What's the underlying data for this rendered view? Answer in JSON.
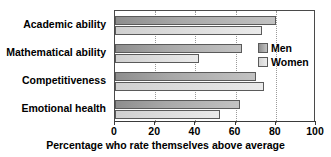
{
  "chart_data": {
    "type": "bar",
    "orientation": "horizontal",
    "title": "",
    "xlabel": "Percentage who rate themselves above average",
    "ylabel": "",
    "xlim": [
      0,
      100
    ],
    "xticks": [
      0,
      20,
      40,
      60,
      80,
      100
    ],
    "xtick_labels": [
      "0",
      "20",
      "40",
      "60",
      "80",
      "100"
    ],
    "grid": true,
    "legend_position": "inside-right",
    "categories": [
      "Academic ability",
      "Mathematical ability",
      "Competitiveness",
      "Emotional health"
    ],
    "series": [
      {
        "name": "Men",
        "color": "#a8a8a8",
        "values": [
          80,
          63,
          70,
          62
        ]
      },
      {
        "name": "Women",
        "color": "#dcdcdc",
        "values": [
          73,
          42,
          74,
          52
        ]
      }
    ]
  },
  "legend": {
    "items": [
      {
        "label": "Men"
      },
      {
        "label": "Women"
      }
    ]
  },
  "caption": "Percentage who rate themselves above average"
}
